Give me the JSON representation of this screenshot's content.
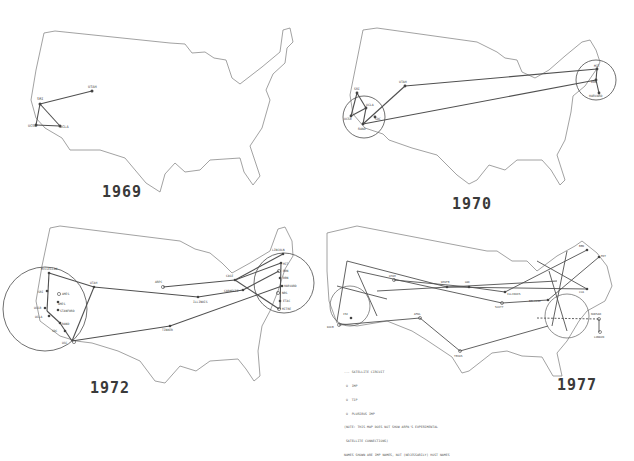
{
  "colors": {
    "background": "#ffffff",
    "outline": "#8a8a8a",
    "links": "#505050",
    "text": "#3a3a3a"
  },
  "panels": [
    {
      "year": "1969",
      "nodes": [
        {
          "label": "SRI",
          "x": 40,
          "y": 104
        },
        {
          "label": "UTAH",
          "x": 92,
          "y": 91
        },
        {
          "label": "UCSB",
          "x": 36,
          "y": 125
        },
        {
          "label": "UCLA",
          "x": 60,
          "y": 126
        }
      ],
      "links": [
        [
          "SRI",
          "UTAH"
        ],
        [
          "SRI",
          "UCSB"
        ],
        [
          "SRI",
          "UCLA"
        ],
        [
          "UCSB",
          "UCLA"
        ]
      ]
    },
    {
      "year": "1970",
      "nodes": [
        {
          "label": "SRI",
          "x": 40,
          "y": 93
        },
        {
          "label": "UTAH",
          "x": 88,
          "y": 86
        },
        {
          "label": "UCLA",
          "x": 49,
          "y": 108
        },
        {
          "label": "UCSB",
          "x": 34,
          "y": 116
        },
        {
          "label": "SDC",
          "x": 58,
          "y": 117
        },
        {
          "label": "RAND",
          "x": 46,
          "y": 124
        },
        {
          "label": "MIT",
          "x": 280,
          "y": 69
        },
        {
          "label": "BBN",
          "x": 279,
          "y": 80
        },
        {
          "label": "HARVARD",
          "x": 282,
          "y": 93
        }
      ],
      "links": [
        [
          "SRI",
          "UCLA"
        ],
        [
          "SRI",
          "UCSB"
        ],
        [
          "UCSB",
          "UCLA"
        ],
        [
          "UCLA",
          "RAND"
        ],
        [
          "RAND",
          "UTAH"
        ],
        [
          "UTAH",
          "MIT"
        ],
        [
          "RAND",
          "BBN"
        ],
        [
          "MIT",
          "BBN"
        ],
        [
          "BBN",
          "HARVARD"
        ]
      ],
      "circles": [
        {
          "cx": 47,
          "cy": 117,
          "r": 21
        },
        {
          "cx": 279,
          "cy": 80,
          "r": 20
        }
      ]
    },
    {
      "year": "1972",
      "nodes": [
        {
          "label": "McCLELLAN",
          "x": 49,
          "y": 62
        },
        {
          "label": "SRI",
          "x": 47,
          "y": 80
        },
        {
          "label": "AMES",
          "x": 59,
          "y": 83
        },
        {
          "label": "AMES",
          "x": 58,
          "y": 91
        },
        {
          "label": "UCSB",
          "x": 43,
          "y": 97
        },
        {
          "label": "STANFORD",
          "x": 60,
          "y": 99
        },
        {
          "label": "UCLA",
          "x": 42,
          "y": 105
        },
        {
          "label": "RAND",
          "x": 60,
          "y": 112
        },
        {
          "label": "SDC",
          "x": 58,
          "y": 119
        },
        {
          "label": "USC",
          "x": 72,
          "y": 130
        },
        {
          "label": "UTAH",
          "x": 94,
          "y": 76
        },
        {
          "label": "TINKER",
          "x": 170,
          "y": 115
        },
        {
          "label": "ILLINOIS",
          "x": 198,
          "y": 86
        },
        {
          "label": "ARPC",
          "x": 163,
          "y": 76
        },
        {
          "label": "CASE",
          "x": 235,
          "y": 69
        },
        {
          "label": "CARNEGIE",
          "x": 243,
          "y": 79
        },
        {
          "label": "LINCOLN",
          "x": 283,
          "y": 43
        },
        {
          "label": "MIT",
          "x": 281,
          "y": 52
        },
        {
          "label": "BBN",
          "x": 279,
          "y": 60
        },
        {
          "label": "BBN",
          "x": 280,
          "y": 67
        },
        {
          "label": "HARVARD",
          "x": 282,
          "y": 75
        },
        {
          "label": "NBS",
          "x": 278,
          "y": 82
        },
        {
          "label": "ETAC",
          "x": 280,
          "y": 90
        },
        {
          "label": "MITRE",
          "x": 279,
          "y": 98
        }
      ],
      "links": [
        [
          "McCLELLAN",
          "UTAH"
        ],
        [
          "UTAH",
          "ILLINOIS"
        ],
        [
          "ILLINOIS",
          "CARNEGIE"
        ],
        [
          "ARPC",
          "CASE"
        ],
        [
          "CASE",
          "LINCOLN"
        ],
        [
          "CASE",
          "MIT"
        ],
        [
          "USC",
          "TINKER"
        ],
        [
          "TINKER",
          "HARVARD"
        ],
        [
          "McCLELLAN",
          "UCLA"
        ],
        [
          "UTAH",
          "USC"
        ],
        [
          "UCLA",
          "USC"
        ]
      ],
      "circles": [
        {
          "cx": 45,
          "cy": 98,
          "r": 42
        },
        {
          "cx": 284,
          "cy": 72,
          "r": 30
        }
      ]
    },
    {
      "year": "1977",
      "legend": [
        "--- SATELLITE CIRCUIT",
        " O  IMP",
        " O  TIP",
        " O  PLURIBUS IMP",
        "(NOTE: THIS MAP DOES NOT SHOW ARPA'S EXPERIMENTAL",
        " SATELLITE CONNECTIONS)",
        "NAMES SHOWN ARE IMP NAMES, NOT (NECESSARILY) HOST NAMES"
      ],
      "nodes": [
        {
          "label": "UTAH",
          "x": 77,
          "y": 69
        },
        {
          "label": "ISI",
          "x": 34,
          "y": 107
        },
        {
          "label": "WPAFB",
          "x": 130,
          "y": 76
        },
        {
          "label": "GWC",
          "x": 152,
          "y": 76
        },
        {
          "label": "BBN",
          "x": 270,
          "y": 39
        },
        {
          "label": "MIT",
          "x": 282,
          "y": 46
        },
        {
          "label": "ILLINOIS",
          "x": 188,
          "y": 81
        },
        {
          "label": "TEXAS",
          "x": 143,
          "y": 140
        },
        {
          "label": "AFWL",
          "x": 103,
          "y": 107
        },
        {
          "label": "LONDON",
          "x": 283,
          "y": 121
        },
        {
          "label": "NORSAR",
          "x": 282,
          "y": 108
        },
        {
          "label": "SCOTT",
          "x": 185,
          "y": 92
        },
        {
          "label": "BELVOIR",
          "x": 231,
          "y": 89
        },
        {
          "label": "CCA",
          "x": 270,
          "y": 78
        },
        {
          "label": "DOCB",
          "x": 22,
          "y": 114
        }
      ],
      "links": [
        [
          "ISI",
          "AFWL"
        ],
        [
          "AFWL",
          "TEXAS"
        ],
        [
          "TEXAS",
          "BELVOIR"
        ],
        [
          "UTAH",
          "GWC"
        ],
        [
          "GWC",
          "ILLINOIS"
        ],
        [
          "ILLINOIS",
          "BBN"
        ],
        [
          "WPAFB",
          "CCA"
        ],
        [
          "DOCB",
          "AFWL"
        ],
        [
          "SCOTT",
          "BELVOIR"
        ],
        [
          "BELVOIR",
          "MIT"
        ],
        [
          "NORSAR",
          "LONDON"
        ]
      ]
    }
  ]
}
